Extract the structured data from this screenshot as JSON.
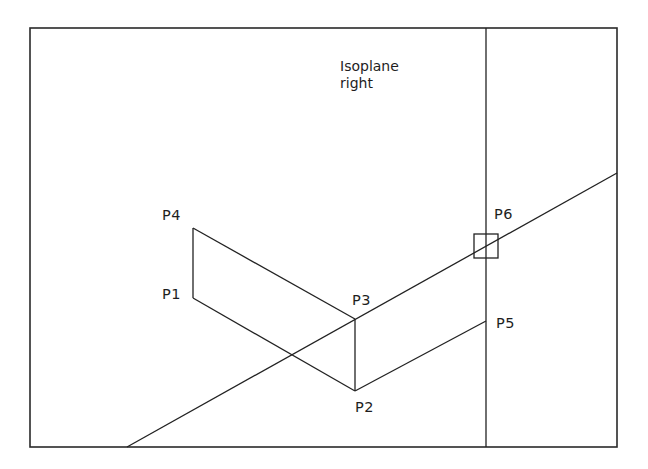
{
  "diagram": {
    "title_lines": [
      "Isoplane",
      "right"
    ],
    "colors": {
      "background": "#ffffff",
      "stroke": "#222222"
    },
    "frame": {
      "x1": 30,
      "y1": 28,
      "x2": 617,
      "y2": 447
    },
    "points": {
      "P1": {
        "label": "P1",
        "x": 193,
        "y": 298
      },
      "P2": {
        "label": "P2",
        "x": 355,
        "y": 391
      },
      "P3": {
        "label": "P3",
        "x": 355,
        "y": 319
      },
      "P4": {
        "label": "P4",
        "x": 193,
        "y": 228
      },
      "P5": {
        "label": "P5",
        "x": 486,
        "y": 321
      },
      "P6": {
        "label": "P6",
        "x": 486,
        "y": 246
      }
    },
    "segments": [
      {
        "from": "P1",
        "to": "P4"
      },
      {
        "from": "P4",
        "to": "P3"
      },
      {
        "from": "P1",
        "to": "P2"
      },
      {
        "from": "P2",
        "to": "P3"
      },
      {
        "from": "P2",
        "to": "P5"
      }
    ],
    "construction_lines": [
      {
        "name": "isometric-axis-line",
        "x1": 127,
        "y1": 447,
        "x2": 617,
        "y2": 173
      },
      {
        "name": "vertical-construction-line",
        "x1": 486,
        "y1": 28,
        "x2": 486,
        "y2": 447
      }
    ],
    "snap_marker": {
      "point": "P6",
      "size": 24
    }
  }
}
